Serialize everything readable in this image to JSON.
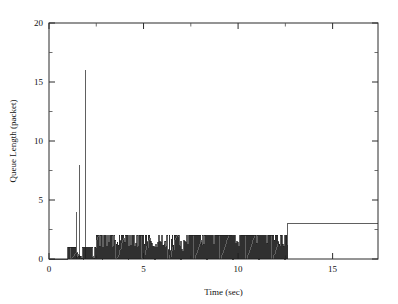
{
  "figure": {
    "background": "#ffffff",
    "line_color": "#1d1d1d",
    "axis_color": "#2b2b2b",
    "width": 398,
    "height": 304
  },
  "axes": {
    "x_title": "Time (sec)",
    "y_title": "Queue Length (packet)",
    "x_ticks": [
      "0",
      "5",
      "10",
      "15"
    ],
    "y_ticks": [
      "0",
      "5",
      "10",
      "15",
      "20"
    ],
    "x_tick_values": [
      0,
      5,
      10,
      15
    ],
    "y_tick_values": [
      0,
      5,
      10,
      15,
      20
    ],
    "x_minor_values": [
      2.5,
      7.5,
      12.5,
      17.5
    ],
    "y_minor_values": [
      2.5,
      7.5,
      12.5,
      17.5
    ],
    "xlim": [
      0,
      17.4
    ],
    "ylim": [
      0,
      20
    ],
    "grid": false,
    "frame": "box",
    "tick_direction": "in"
  },
  "chart_data": {
    "type": "line",
    "title": "",
    "xlabel": "Time (sec)",
    "ylabel": "Queue Length (packet)",
    "xlim": [
      0,
      17.4
    ],
    "ylim": [
      0,
      20
    ],
    "grid": false,
    "legend": "none",
    "series": [
      {
        "name": "Queue Length",
        "color": "#1d1d1d",
        "description": "Router queue occupancy over time: dense sawtooth oscillation 0-1 packets from 1.0-2.5s with three transient spikes reaching 4, 8 and 16 packets near 1.45s, 1.6s and 1.95s; sustained dense oscillation 0-2 packets from 2.5s to 12.6s; step up to a flat level of 3 packets from 12.6s to the end of trace at 17.4s.",
        "segments": [
          {
            "label": "idle",
            "t_start": 0.0,
            "t_end": 1.0,
            "low": 0,
            "high": 0,
            "kind": "flat"
          },
          {
            "label": "early-oscillation",
            "t_start": 1.0,
            "t_end": 2.5,
            "low": 0,
            "high": 1,
            "kind": "sawtooth",
            "period": 0.055
          },
          {
            "label": "main-oscillation",
            "t_start": 2.5,
            "t_end": 12.6,
            "low": 0,
            "high": 2,
            "kind": "sawtooth",
            "period": 0.055
          },
          {
            "label": "step-plateau",
            "t_start": 12.6,
            "t_end": 17.4,
            "low": 3,
            "high": 3,
            "kind": "flat"
          }
        ],
        "spikes": [
          {
            "t": 1.45,
            "value": 4.0
          },
          {
            "t": 1.62,
            "value": 8.0
          },
          {
            "t": 1.95,
            "value": 16.0
          }
        ],
        "deep_dips": [
          {
            "t_start": 5.4,
            "t_end": 7.2,
            "floor": 0
          }
        ],
        "key_points": [
          {
            "t": 0.0,
            "y": 0
          },
          {
            "t": 1.0,
            "y": 0
          },
          {
            "t": 1.45,
            "y": 4.0
          },
          {
            "t": 1.62,
            "y": 8.0
          },
          {
            "t": 1.95,
            "y": 16.0
          },
          {
            "t": 2.5,
            "y": 2
          },
          {
            "t": 12.6,
            "y": 2
          },
          {
            "t": 12.65,
            "y": 3
          },
          {
            "t": 17.4,
            "y": 3
          }
        ]
      }
    ]
  }
}
